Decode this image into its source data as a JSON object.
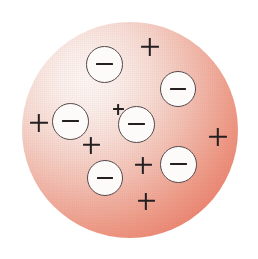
{
  "figure": {
    "title": "Thomson plum pudding atomic model",
    "description": "A large pink-red sphere of uniform positive charge with six white circular electrons embedded in it and seven plus signs distributed through the positive medium.",
    "canvas": {
      "width": 258,
      "height": 259,
      "background": "#ffffff"
    }
  },
  "sphere": {
    "name": "positive-charge-sphere",
    "center_x": 130,
    "center_y": 130,
    "radius": 108,
    "gradient": {
      "highlight_x_pct": 30,
      "highlight_y_pct": 27,
      "stops": [
        {
          "offset_pct": 0,
          "color": "#fdf7f5"
        },
        {
          "offset_pct": 14,
          "color": "#fbeeea"
        },
        {
          "offset_pct": 30,
          "color": "#f7dcd4"
        },
        {
          "offset_pct": 48,
          "color": "#f3bfb2"
        },
        {
          "offset_pct": 66,
          "color": "#ef9f8c"
        },
        {
          "offset_pct": 82,
          "color": "#ec8470"
        },
        {
          "offset_pct": 94,
          "color": "#e9735f"
        },
        {
          "offset_pct": 100,
          "color": "#e86d58"
        }
      ]
    },
    "edge_color": "#e86d58",
    "core_color": "#fdf7f5"
  },
  "electrons": {
    "symbol": "−",
    "count": 6,
    "fill_color": "#fdfbfa",
    "outline_color": "#55494a",
    "sign_color": "#241f20",
    "items": [
      {
        "id": "electron-top",
        "label": "−",
        "cx": 104,
        "cy": 64,
        "r": 18.5,
        "sign_w": 17,
        "sign_h": 2.4
      },
      {
        "id": "electron-upper-right",
        "label": "−",
        "cx": 178,
        "cy": 89,
        "r": 18.0,
        "sign_w": 16,
        "sign_h": 2.3
      },
      {
        "id": "electron-left",
        "label": "−",
        "cx": 70,
        "cy": 121,
        "r": 18.5,
        "sign_w": 17,
        "sign_h": 2.4
      },
      {
        "id": "electron-center",
        "label": "−",
        "cx": 136,
        "cy": 124,
        "r": 18.5,
        "sign_w": 17,
        "sign_h": 2.4
      },
      {
        "id": "electron-lower-left",
        "label": "−",
        "cx": 105,
        "cy": 178,
        "r": 18.0,
        "sign_w": 16,
        "sign_h": 2.3
      },
      {
        "id": "electron-lower-right",
        "label": "−",
        "cx": 178,
        "cy": 164,
        "r": 18.5,
        "sign_w": 17,
        "sign_h": 2.4
      }
    ]
  },
  "positive_charges": {
    "symbol": "+",
    "count": 7,
    "color": "#241f20",
    "items": [
      {
        "id": "plus-top",
        "label": "+",
        "cx": 150,
        "cy": 47,
        "size": 18,
        "thickness": 2.4
      },
      {
        "id": "plus-left",
        "label": "+",
        "cx": 39,
        "cy": 123,
        "size": 18,
        "thickness": 2.4
      },
      {
        "id": "plus-right",
        "label": "+",
        "cx": 218,
        "cy": 137,
        "size": 18,
        "thickness": 2.4
      },
      {
        "id": "plus-mid-left",
        "label": "+",
        "cx": 91,
        "cy": 145,
        "size": 17,
        "thickness": 2.3
      },
      {
        "id": "plus-mid-bottom",
        "label": "+",
        "cx": 143,
        "cy": 165,
        "size": 17,
        "thickness": 2.3
      },
      {
        "id": "plus-bottom",
        "label": "+",
        "cx": 146,
        "cy": 201,
        "size": 17,
        "thickness": 2.3
      },
      {
        "id": "plus-upper-center",
        "label": "+",
        "cx": 118,
        "cy": 109,
        "size": 11,
        "thickness": 1.8
      }
    ]
  }
}
